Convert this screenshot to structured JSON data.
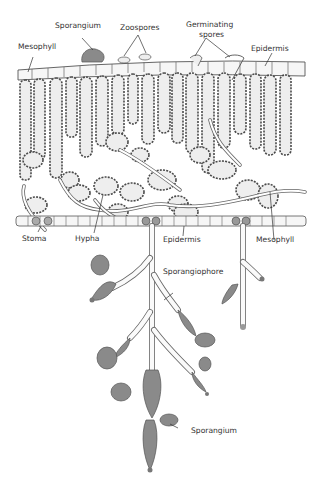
{
  "figure": {
    "labels": {
      "sporangium_top": "Sporangium",
      "zoospores": "Zoospores",
      "germinating_spores": "Germinating spores",
      "germinating_line1": "Germinating",
      "germinating_line2": "spores",
      "mesophyll_top": "Mesophyll",
      "epidermis_top": "Epidermis",
      "stoma": "Stoma",
      "hypha": "Hypha",
      "epidermis_bottom": "Epidermis",
      "mesophyll_bottom": "Mesophyll",
      "sporangiophore": "Sporangiophore",
      "sporangium_bottom": "Sporangium"
    },
    "colors": {
      "background": "#ffffff",
      "outline": "#4a4a4a",
      "sporangium_fill": "#8a8a8a",
      "text": "#333333"
    }
  }
}
